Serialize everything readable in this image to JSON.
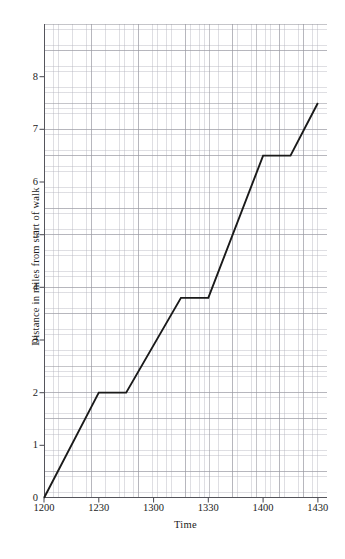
{
  "chart_data": {
    "type": "line",
    "title": "",
    "xlabel": "Time",
    "ylabel": "Distance in miles from start of walk",
    "xlim": [
      1200,
      1435
    ],
    "ylim": [
      0,
      9
    ],
    "grid": true,
    "legend": null,
    "x_tick_labels": [
      "1200",
      "1230",
      "1300",
      "1330",
      "1400",
      "1430"
    ],
    "x_tick_values": [
      1200,
      1230,
      1300,
      1330,
      1400,
      1430
    ],
    "y_tick_labels": [
      "0",
      "1",
      "2",
      "3",
      "4",
      "5",
      "6",
      "7",
      "8"
    ],
    "y_tick_values": [
      0,
      1,
      2,
      3,
      4,
      5,
      6,
      7,
      8
    ],
    "series": [
      {
        "name": "Distance walked",
        "color": "#1a1a1a",
        "points": [
          {
            "x": 1200,
            "y": 0
          },
          {
            "x": 1230,
            "y": 2
          },
          {
            "x": 1245,
            "y": 2
          },
          {
            "x": 1315,
            "y": 3.8
          },
          {
            "x": 1330,
            "y": 3.8
          },
          {
            "x": 1400,
            "y": 6.5
          },
          {
            "x": 1415,
            "y": 6.5
          },
          {
            "x": 1430,
            "y": 7.5
          }
        ]
      }
    ]
  },
  "axes": {
    "x_title": "Time",
    "y_title": "Distance in miles from start of walk"
  }
}
